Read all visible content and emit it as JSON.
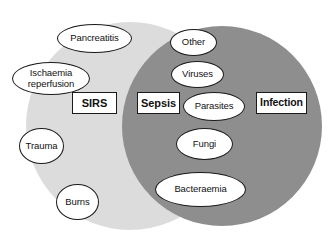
{
  "diagram": {
    "type": "venn",
    "background_color": "#ffffff",
    "sets": [
      {
        "name": "sirs-circle",
        "label": "SIRS",
        "fill": "#dcdcdc",
        "cx": 130,
        "cy": 126,
        "r": 104
      },
      {
        "name": "infection-circle",
        "label": "Infection",
        "fill": "#8e8e8e",
        "cx": 222,
        "cy": 126,
        "r": 100
      }
    ],
    "boxes": [
      {
        "id": "sirs",
        "label": "SIRS",
        "x": 72,
        "y": 92,
        "w": 45,
        "h": 22,
        "font_size": 11
      },
      {
        "id": "sepsis",
        "label": "Sepsis",
        "x": 137,
        "y": 92,
        "w": 43,
        "h": 22,
        "font_size": 11
      },
      {
        "id": "infection",
        "label": "Infection",
        "x": 256,
        "y": 92,
        "w": 51,
        "h": 22,
        "font_size": 10.5
      }
    ],
    "ovals": [
      {
        "id": "pancreatitis",
        "label": "Pancreatitis",
        "x": 57,
        "y": 24,
        "w": 75,
        "h": 29,
        "font_size": 9.5,
        "region": "sirs-only"
      },
      {
        "id": "ischaemia-reperfusion",
        "label": "Ischaemia\nreperfusion",
        "x": 12,
        "y": 62,
        "w": 78,
        "h": 33,
        "font_size": 9.5,
        "region": "sirs-only"
      },
      {
        "id": "trauma",
        "label": "Trauma",
        "x": 19,
        "y": 128,
        "w": 45,
        "h": 36,
        "font_size": 9.5,
        "region": "sirs-only"
      },
      {
        "id": "burns",
        "label": "Burns",
        "x": 56,
        "y": 184,
        "w": 43,
        "h": 36,
        "font_size": 9.5,
        "region": "sirs-only"
      },
      {
        "id": "other",
        "label": "Other",
        "x": 170,
        "y": 29,
        "w": 47,
        "h": 27,
        "font_size": 9.5,
        "region": "infection"
      },
      {
        "id": "viruses",
        "label": "Viruses",
        "x": 171,
        "y": 61,
        "w": 53,
        "h": 27,
        "font_size": 9.5,
        "region": "infection"
      },
      {
        "id": "parasites",
        "label": "Parasites",
        "x": 183,
        "y": 92,
        "w": 62,
        "h": 29,
        "font_size": 9.5,
        "region": "infection"
      },
      {
        "id": "fungi",
        "label": "Fungi",
        "x": 176,
        "y": 128,
        "w": 57,
        "h": 32,
        "font_size": 9.5,
        "region": "infection"
      },
      {
        "id": "bacteraemia",
        "label": "Bacteraemia",
        "x": 155,
        "y": 172,
        "w": 91,
        "h": 35,
        "font_size": 9.5,
        "region": "infection"
      }
    ]
  }
}
